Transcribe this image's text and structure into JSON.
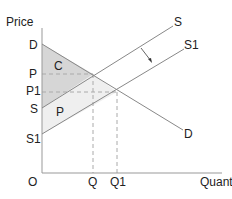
{
  "diagram": {
    "type": "supply-demand",
    "axes": {
      "y_label": "Price",
      "x_label": "Quantity",
      "origin_label": "O"
    },
    "y_ticks": {
      "D": "D",
      "P": "P",
      "P1": "P1",
      "S": "S",
      "S1": "S1"
    },
    "x_ticks": {
      "Q": "Q",
      "Q1": "Q1"
    },
    "curves": {
      "S": "S",
      "S1": "S1",
      "D": "D"
    },
    "regions": {
      "consumer_surplus": "C",
      "producer_surplus": "P"
    },
    "colors": {
      "consumer_surplus_fill": "#d9d9d9",
      "producer_surplus_fill": "#eeeeee",
      "line": "#888888",
      "axis": "#999999",
      "dashed": "#aaaaaa",
      "text": "#222222"
    }
  }
}
